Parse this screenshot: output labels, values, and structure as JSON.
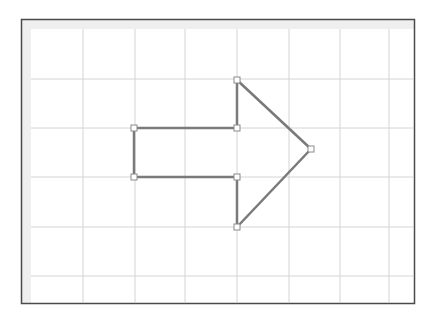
{
  "canvas": {
    "frame": {
      "x": 21,
      "y": 19,
      "width": 394,
      "height": 285
    },
    "margin_strip": {
      "top_height": 10,
      "left_width": 10
    },
    "grid": {
      "vertical_lines_x": [
        83,
        135,
        185,
        237,
        289,
        340,
        389
      ],
      "horizontal_lines_y": [
        79,
        128,
        177,
        227,
        276
      ]
    },
    "colors": {
      "background": "#ffffff",
      "frame_border": "#4a4a4a",
      "margin_strip": "#efefef",
      "grid_line": "#d4d4d4",
      "shape_stroke": "#7a7a7a",
      "handle_fill": "#ffffff",
      "handle_stroke": "#8a8a8a"
    }
  },
  "shape": {
    "type": "right-arrow-polygon",
    "vertices": [
      {
        "name": "shaft-top-left",
        "x": 134,
        "y": 128
      },
      {
        "name": "shaft-top-right",
        "x": 237,
        "y": 128
      },
      {
        "name": "head-top",
        "x": 237,
        "y": 80
      },
      {
        "name": "arrow-tip",
        "x": 311,
        "y": 149
      },
      {
        "name": "head-bottom",
        "x": 237,
        "y": 227
      },
      {
        "name": "shaft-bottom-right",
        "x": 237,
        "y": 177
      },
      {
        "name": "shaft-bottom-left",
        "x": 134,
        "y": 177
      }
    ]
  }
}
